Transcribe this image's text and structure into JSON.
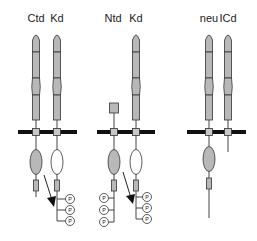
{
  "diagram": {
    "groups": [
      {
        "id": "ctd-kd",
        "labels": [
          {
            "text": "Ctd",
            "x": 36
          },
          {
            "text": "Kd",
            "x": 57
          }
        ],
        "membrane": [
          18,
          77
        ]
      },
      {
        "id": "ntd-kd",
        "labels": [
          {
            "text": "Ntd",
            "x": 113
          },
          {
            "text": "Kd",
            "x": 136
          }
        ],
        "membrane": [
          97,
          155
        ]
      },
      {
        "id": "neu-icd",
        "labels": [
          {
            "text": "neu",
            "x": 209
          },
          {
            "text": "ICd",
            "x": 228
          }
        ],
        "membrane": [
          187,
          246
        ]
      }
    ],
    "label_y": 22,
    "membrane_y": 132,
    "phospho_label": "P",
    "colors": {
      "segment": "#b8b8b8",
      "membrane": "#111111",
      "outline": "#333333"
    }
  }
}
